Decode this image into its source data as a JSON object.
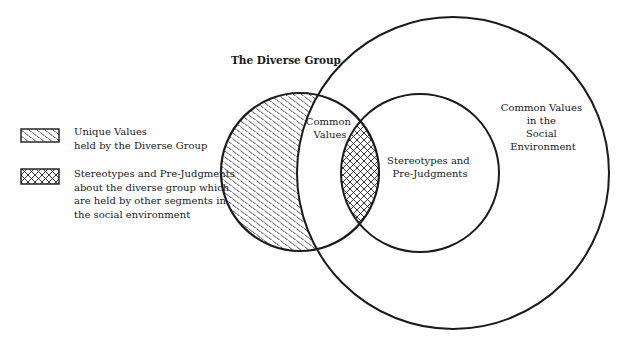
{
  "diagram": {
    "title": "The Diverse Group",
    "regions": {
      "common_values": {
        "line1": "Common",
        "line2": "Values"
      },
      "stereotypes": {
        "line1": "Stereotypes and",
        "line2": "Pre-Judgments"
      },
      "social_environment": {
        "line1": "Common Values",
        "line2": "in the",
        "line3": "Social",
        "line4": "Environment"
      }
    },
    "circles": [
      {
        "name": "diverse-group",
        "cx": 300,
        "cy": 172,
        "r": 79
      },
      {
        "name": "stereotypes",
        "cx": 420,
        "cy": 173,
        "r": 79
      },
      {
        "name": "social-environment",
        "cx": 453,
        "cy": 173,
        "r": 156
      }
    ],
    "colors": {
      "stroke": "#1a1a1a",
      "background": "#ffffff"
    }
  },
  "legend": {
    "items": [
      {
        "pattern": "diagonal-dash-hatch",
        "line1": "Unique Values",
        "line2": "held by the Diverse Group"
      },
      {
        "pattern": "crosshatch",
        "line1": "Stereotypes and Pre-Judgments",
        "line2": "about the diverse group which",
        "line3": "are held by other segments in",
        "line4": "the social environment"
      }
    ]
  }
}
